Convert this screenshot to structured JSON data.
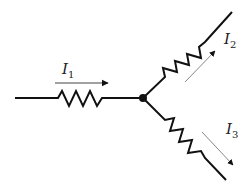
{
  "diagram": {
    "type": "circuit-junction",
    "node": {
      "x": 143,
      "y": 98
    },
    "branches": [
      {
        "id": "branch-1",
        "current_label": "I",
        "current_sub": "1",
        "direction": "into-node"
      },
      {
        "id": "branch-2",
        "current_label": "I",
        "current_sub": "2",
        "direction": "out-of-node"
      },
      {
        "id": "branch-3",
        "current_label": "I",
        "current_sub": "3",
        "direction": "out-of-node"
      }
    ],
    "colors": {
      "wire": "#111111",
      "arrow": "#111111",
      "arrow_line": "#888888"
    }
  },
  "labels": {
    "i1": "I",
    "i1_sub": "1",
    "i2": "I",
    "i2_sub": "2",
    "i3": "I",
    "i3_sub": "3"
  }
}
